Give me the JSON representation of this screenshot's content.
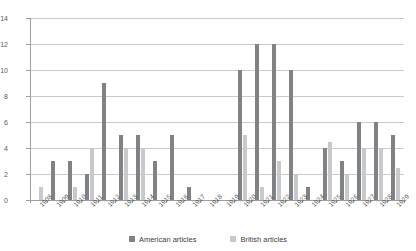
{
  "chart_data": {
    "type": "bar",
    "title": "",
    "subtitle": "",
    "xlabel": "",
    "ylabel": "",
    "ylim": [
      0,
      14
    ],
    "ytick_step": 2,
    "yticks": [
      0,
      2,
      4,
      6,
      8,
      10,
      12,
      14
    ],
    "grid": true,
    "legend_position": "bottom",
    "categories": [
      "1908",
      "1909",
      "1910",
      "1911",
      "1912",
      "1913",
      "1914",
      "1915",
      "1916",
      "1917",
      "1918",
      "1919",
      "1920",
      "1921",
      "1922",
      "1923",
      "1924",
      "1925",
      "1926",
      "1927",
      "1928",
      "1929"
    ],
    "series": [
      {
        "name": "American articles",
        "color": "#808285",
        "values": [
          0,
          3,
          3,
          2,
          9,
          5,
          5,
          3,
          5,
          1,
          0,
          0,
          10,
          12,
          12,
          10,
          1,
          4,
          3,
          6,
          6,
          5
        ]
      },
      {
        "name": "British articles",
        "color": "#c8c9cb",
        "values": [
          1,
          0,
          1,
          4,
          0,
          4,
          4,
          0,
          0,
          0,
          0,
          0,
          5,
          1,
          3,
          2,
          0,
          4.5,
          2,
          4,
          4,
          2.5
        ]
      }
    ]
  },
  "legend": {
    "items": [
      {
        "label": "American articles",
        "color": "#808285"
      },
      {
        "label": "British articles",
        "color": "#c8c9cb"
      }
    ]
  },
  "axes": {
    "y_tick_labels": [
      "0",
      "2",
      "4",
      "6",
      "8",
      "10",
      "12",
      "14"
    ],
    "x_tick_labels": [
      "1908",
      "1909",
      "1910",
      "1911",
      "1912",
      "1913",
      "1914",
      "1915",
      "1916",
      "1917",
      "1918",
      "1919",
      "1920",
      "1921",
      "1922",
      "1923",
      "1924",
      "1925",
      "1926",
      "1927",
      "1928",
      "1929"
    ]
  },
  "colors": {
    "american": "#808285",
    "british": "#c8c9cb",
    "grid": "#c9cbcd",
    "axis": "#9d9fa2",
    "text": "#58595b"
  }
}
